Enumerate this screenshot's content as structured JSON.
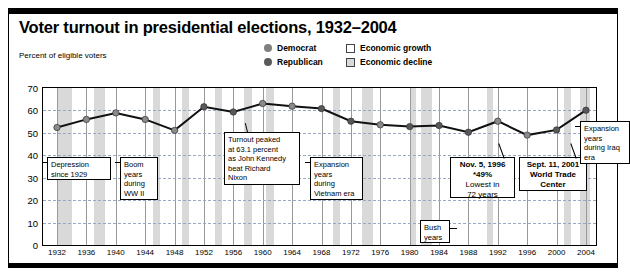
{
  "header": {
    "title": "Voter turnout in presidential elections, 1932–2004",
    "axis_caption": "Percent of eligible voters"
  },
  "legend": {
    "items": [
      {
        "label": "Democrat",
        "marker": "filled-circle",
        "color": "#808080"
      },
      {
        "label": "Republican",
        "marker": "filled-circle",
        "color": "#5a5a5a"
      },
      {
        "label": "Economic growth",
        "marker": "open-square",
        "color": "#ffffff"
      },
      {
        "label": "Economic decline",
        "marker": "shaded-square",
        "color": "#d9d9d9"
      }
    ]
  },
  "callouts": [
    {
      "name": "depression-callout",
      "lines": [
        "Depression",
        "since 1929"
      ],
      "bold": false,
      "x": 38,
      "y": 148,
      "w": 64,
      "h": 23,
      "leader": "left-up"
    },
    {
      "name": "boom-ww2-callout",
      "lines": [
        "Boom",
        "years",
        "during",
        "WW II"
      ],
      "bold": false,
      "x": 111,
      "y": 148,
      "w": 38,
      "h": 43,
      "leader": "left-up"
    },
    {
      "name": "kennedy-peak-callout",
      "lines": [
        "Turnout peaked",
        "at 63.1 percent",
        "as John Kennedy",
        "beat Richard",
        "Nixon"
      ],
      "bold": false,
      "x": 215,
      "y": 123,
      "w": 76,
      "h": 53,
      "leader": "top"
    },
    {
      "name": "vietnam-expansion-callout",
      "lines": [
        "Expansion",
        "years",
        "during",
        "Vietnam era"
      ],
      "bold": false,
      "x": 301,
      "y": 148,
      "w": 53,
      "h": 43,
      "leader": "left"
    },
    {
      "name": "bush-years-callout",
      "lines": [
        "Bush",
        "years"
      ],
      "bold": false,
      "x": 411,
      "y": 211,
      "w": 30,
      "h": 23,
      "leader": "right"
    },
    {
      "name": "lowest-turnout-1996-callout",
      "lines": [
        "Nov. 5, 1996",
        "*49%",
        "Lowest in",
        "72 years"
      ],
      "bold": true,
      "subs": [
        2,
        3
      ],
      "x": 441,
      "y": 148,
      "w": 65,
      "h": 41,
      "leader": "top-right"
    },
    {
      "name": "sept11-callout",
      "lines": [
        "Sept. 11, 2001",
        "World Trade",
        "Center"
      ],
      "bold": true,
      "x": 510,
      "y": 148,
      "w": 68,
      "h": 34,
      "leader": "top-right"
    },
    {
      "name": "iraq-expansion-callout",
      "lines": [
        "Expansion",
        "years",
        "during Iraq",
        "era"
      ],
      "bold": false,
      "x": 571,
      "y": 112,
      "w": 50,
      "h": 43,
      "leader": "left"
    }
  ],
  "chart_data": {
    "type": "line",
    "title": "Voter turnout in presidential elections, 1932–2004",
    "xlabel": "",
    "ylabel": "Percent of eligible voters",
    "ylim": [
      0,
      70
    ],
    "ytick_step": 10,
    "yticks": [
      0,
      10,
      20,
      30,
      40,
      50,
      60,
      70
    ],
    "grid": true,
    "legend_position": "top-right",
    "categories": [
      1932,
      1936,
      1940,
      1944,
      1948,
      1952,
      1956,
      1960,
      1964,
      1968,
      1972,
      1976,
      1980,
      1984,
      1988,
      1992,
      1996,
      2000,
      2004
    ],
    "xticklabels": [
      "1932",
      "1936",
      "1940",
      "1944",
      "1948",
      "1952",
      "1956",
      "1960",
      "1964",
      "1968",
      "1972",
      "1976",
      "1980",
      "1984",
      "1988",
      "1992",
      "1996",
      "2000",
      "2004"
    ],
    "series": [
      {
        "name": "Voter turnout",
        "values": [
          52.4,
          56.0,
          58.9,
          56.0,
          51.1,
          61.6,
          59.3,
          63.1,
          61.9,
          60.8,
          55.2,
          53.6,
          52.8,
          53.3,
          50.3,
          55.2,
          49.0,
          51.3,
          60.1
        ]
      }
    ],
    "point_party": [
      "D",
      "D",
      "D",
      "D",
      "D",
      "R",
      "R",
      "D",
      "D",
      "R",
      "R",
      "D",
      "R",
      "R",
      "R",
      "D",
      "D",
      "R",
      "R"
    ],
    "economic_bands": [
      {
        "type": "decline",
        "start": 1932,
        "end": 1934
      },
      {
        "type": "decline",
        "start": 1937,
        "end": 1938.5
      },
      {
        "type": "decline",
        "start": 1945,
        "end": 1946
      },
      {
        "type": "decline",
        "start": 1949,
        "end": 1950
      },
      {
        "type": "decline",
        "start": 1953.5,
        "end": 1954.5
      },
      {
        "type": "decline",
        "start": 1957.5,
        "end": 1958.5
      },
      {
        "type": "decline",
        "start": 1960.5,
        "end": 1961.5
      },
      {
        "type": "decline",
        "start": 1969.5,
        "end": 1970.5
      },
      {
        "type": "decline",
        "start": 1973.5,
        "end": 1975
      },
      {
        "type": "decline",
        "start": 1980,
        "end": 1980.8
      },
      {
        "type": "decline",
        "start": 1981.5,
        "end": 1983
      },
      {
        "type": "decline",
        "start": 1990.5,
        "end": 1991.3
      },
      {
        "type": "decline",
        "start": 2001,
        "end": 2002
      },
      {
        "type": "decline",
        "start": 2003.2,
        "end": 2004.6
      }
    ],
    "annotations": [
      "Depression since 1929",
      "Boom years during WW II",
      "Turnout peaked at 63.1 percent as John Kennedy beat Richard Nixon",
      "Expansion years during Vietnam era",
      "Bush years",
      "Nov. 5, 1996 *49% Lowest in 72 years",
      "Sept. 11, 2001 World Trade Center",
      "Expansion years during Iraq era"
    ]
  }
}
